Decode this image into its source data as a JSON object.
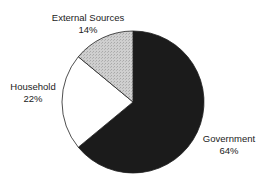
{
  "chart_data": {
    "type": "pie",
    "title": "",
    "categories": [
      "Government",
      "Household",
      "External Sources"
    ],
    "values": [
      64,
      22,
      14
    ],
    "units": "%",
    "colors": [
      "#1b1b1b",
      "#ffffff",
      "#c9c9c9"
    ],
    "start_angle_deg": 0,
    "direction": "clockwise-from-top for Government",
    "legend": "none (direct labels)",
    "labels": [
      {
        "name": "Government",
        "pct": "64%"
      },
      {
        "name": "Household",
        "pct": "22%"
      },
      {
        "name": "External Sources",
        "pct": "14%"
      }
    ]
  },
  "geometry": {
    "cx": 133,
    "cy": 102,
    "r": 71
  }
}
